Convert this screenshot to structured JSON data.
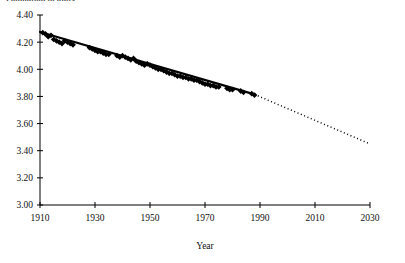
{
  "figure": {
    "cropped_header_text": "Population in units",
    "plot_area": {
      "left": 40,
      "right": 370,
      "top": 15,
      "bottom": 205
    }
  },
  "chart_data": {
    "type": "scatter",
    "title": "",
    "subtitle": "",
    "xlabel": "Year",
    "ylabel": "",
    "xlim": [
      1910,
      2030
    ],
    "ylim": [
      3.0,
      4.4
    ],
    "grid": false,
    "legend": null,
    "x_ticks": [
      1910,
      1930,
      1950,
      1970,
      1990,
      2010,
      2030
    ],
    "x_tick_labels": [
      "1910",
      "1930",
      "1950",
      "1970",
      "1990",
      "2010",
      "2030"
    ],
    "y_ticks": [
      3.0,
      3.2,
      3.4,
      3.6,
      3.8,
      4.0,
      4.2,
      4.4
    ],
    "y_tick_labels": [
      "3.00",
      "3.20",
      "3.40",
      "3.60",
      "3.80",
      "4.00",
      "4.20",
      "4.40"
    ],
    "marker": "filled-diamond",
    "marker_color": "#000000",
    "series": [
      {
        "name": "observations",
        "points": [
          [
            1911,
            4.27
          ],
          [
            1912,
            4.26
          ],
          [
            1913,
            4.24
          ],
          [
            1914,
            4.25
          ],
          [
            1915,
            4.22
          ],
          [
            1916,
            4.21
          ],
          [
            1917,
            4.2
          ],
          [
            1918,
            4.19
          ],
          [
            1919,
            4.21
          ],
          [
            1920,
            4.2
          ],
          [
            1921,
            4.19
          ],
          [
            1922,
            4.18
          ],
          [
            1928,
            4.16
          ],
          [
            1929,
            4.15
          ],
          [
            1930,
            4.14
          ],
          [
            1931,
            4.13
          ],
          [
            1932,
            4.13
          ],
          [
            1933,
            4.12
          ],
          [
            1934,
            4.11
          ],
          [
            1935,
            4.11
          ],
          [
            1938,
            4.1
          ],
          [
            1939,
            4.09
          ],
          [
            1940,
            4.1
          ],
          [
            1941,
            4.09
          ],
          [
            1942,
            4.08
          ],
          [
            1943,
            4.07
          ],
          [
            1944,
            4.08
          ],
          [
            1945,
            4.06
          ],
          [
            1946,
            4.05
          ],
          [
            1947,
            4.04
          ],
          [
            1948,
            4.03
          ],
          [
            1949,
            4.04
          ],
          [
            1950,
            4.03
          ],
          [
            1951,
            4.02
          ],
          [
            1952,
            4.01
          ],
          [
            1953,
            4.0
          ],
          [
            1954,
            4.0
          ],
          [
            1955,
            3.99
          ],
          [
            1956,
            3.98
          ],
          [
            1957,
            3.97
          ],
          [
            1958,
            3.97
          ],
          [
            1959,
            3.96
          ],
          [
            1960,
            3.95
          ],
          [
            1961,
            3.95
          ],
          [
            1962,
            3.94
          ],
          [
            1963,
            3.94
          ],
          [
            1964,
            3.93
          ],
          [
            1965,
            3.93
          ],
          [
            1966,
            3.92
          ],
          [
            1967,
            3.92
          ],
          [
            1968,
            3.91
          ],
          [
            1969,
            3.9
          ],
          [
            1970,
            3.89
          ],
          [
            1971,
            3.89
          ],
          [
            1972,
            3.88
          ],
          [
            1973,
            3.88
          ],
          [
            1974,
            3.87
          ],
          [
            1975,
            3.87
          ],
          [
            1978,
            3.86
          ],
          [
            1979,
            3.85
          ],
          [
            1980,
            3.85
          ],
          [
            1983,
            3.84
          ],
          [
            1984,
            3.83
          ],
          [
            1987,
            3.82
          ],
          [
            1988,
            3.81
          ]
        ]
      }
    ],
    "trend_line": {
      "name": "fitted-trend",
      "style": "solid",
      "color": "#000000",
      "x_start": 1910,
      "y_start": 4.275,
      "x_end": 1988,
      "y_end": 3.815
    },
    "extrapolation_line": {
      "name": "extrapolation",
      "style": "dotted",
      "color": "#000000",
      "x_start": 1988,
      "y_start": 3.815,
      "x_end": 2030,
      "y_end": 3.45
    }
  }
}
